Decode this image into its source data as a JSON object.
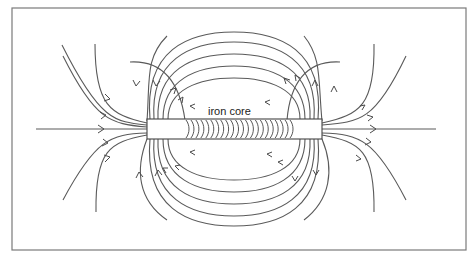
{
  "diagram": {
    "core_label": "iron core",
    "colors": {
      "line": "#5a5a5a",
      "frame": "#7a7a7a",
      "background": "#ffffff"
    },
    "core": {
      "x": 147,
      "y": 119,
      "width": 175,
      "height": 20
    },
    "coil": {
      "x_start": 186,
      "x_end": 290,
      "turns": 22
    },
    "axis": {
      "y": 129,
      "x_start": 36,
      "x_end": 436
    },
    "frame": {
      "x": 12,
      "y": 8,
      "width": 454,
      "height": 242
    }
  }
}
